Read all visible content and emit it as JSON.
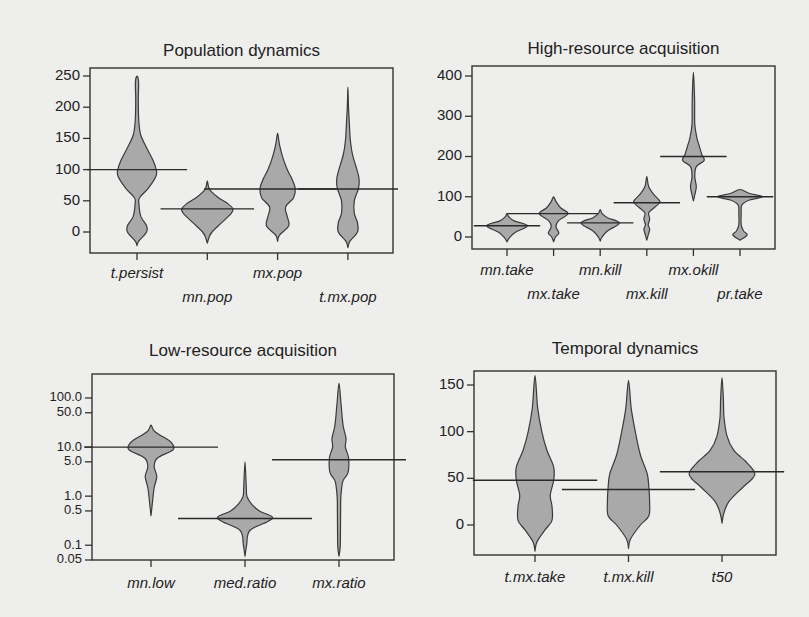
{
  "colors": {
    "violin_fill": "#a9a9a9",
    "violin_stroke": "#3a3a3a",
    "background": "#eeeeec"
  },
  "chart_data": [
    {
      "type": "violin",
      "title": "Population dynamics",
      "yscale": "linear",
      "ylim": [
        -30,
        260
      ],
      "yticks": [
        0,
        50,
        100,
        150,
        200,
        250
      ],
      "ytick_labels": [
        "0",
        "50",
        "100",
        "150",
        "200",
        "250"
      ],
      "categories": [
        "t.persist",
        "mn.pop",
        "mx.pop",
        "t.mx.pop"
      ],
      "label_rows": [
        0,
        1,
        0,
        1
      ],
      "violins": [
        {
          "name": "t.persist",
          "median": 100,
          "median_span": 1.5,
          "profile": [
            [
              -22,
              0
            ],
            [
              -15,
              0.05
            ],
            [
              0,
              0.3
            ],
            [
              10,
              0.3
            ],
            [
              25,
              0.12
            ],
            [
              45,
              0.06
            ],
            [
              55,
              0.08
            ],
            [
              70,
              0.35
            ],
            [
              90,
              0.6
            ],
            [
              100,
              0.6
            ],
            [
              115,
              0.5
            ],
            [
              135,
              0.3
            ],
            [
              155,
              0.12
            ],
            [
              175,
              0.06
            ],
            [
              210,
              0.04
            ],
            [
              240,
              0.05
            ],
            [
              250,
              0
            ]
          ]
        },
        {
          "name": "mn.pop",
          "median": 37,
          "median_span": 1.4,
          "profile": [
            [
              -18,
              0
            ],
            [
              -8,
              0.06
            ],
            [
              0,
              0.15
            ],
            [
              15,
              0.45
            ],
            [
              30,
              0.75
            ],
            [
              37,
              0.8
            ],
            [
              45,
              0.65
            ],
            [
              55,
              0.35
            ],
            [
              65,
              0.12
            ],
            [
              72,
              0.04
            ],
            [
              82,
              0
            ]
          ]
        },
        {
          "name": "mx.pop",
          "median": 69,
          "median_span": 2.2,
          "profile": [
            [
              -15,
              0
            ],
            [
              -5,
              0.06
            ],
            [
              10,
              0.35
            ],
            [
              25,
              0.3
            ],
            [
              40,
              0.25
            ],
            [
              55,
              0.5
            ],
            [
              70,
              0.55
            ],
            [
              85,
              0.45
            ],
            [
              100,
              0.3
            ],
            [
              120,
              0.16
            ],
            [
              140,
              0.06
            ],
            [
              158,
              0
            ]
          ]
        },
        {
          "name": "t.mx.pop",
          "median": 69,
          "median_span": 1.5,
          "profile": [
            [
              -25,
              0
            ],
            [
              -15,
              0.06
            ],
            [
              0,
              0.3
            ],
            [
              15,
              0.3
            ],
            [
              30,
              0.2
            ],
            [
              50,
              0.2
            ],
            [
              70,
              0.33
            ],
            [
              85,
              0.35
            ],
            [
              100,
              0.28
            ],
            [
              125,
              0.14
            ],
            [
              145,
              0.08
            ],
            [
              160,
              0.06
            ],
            [
              200,
              0.02
            ],
            [
              232,
              0
            ]
          ]
        }
      ]
    },
    {
      "type": "violin",
      "title": "High-resource acquisition",
      "yscale": "linear",
      "ylim": [
        -25,
        420
      ],
      "yticks": [
        0,
        100,
        200,
        300,
        400
      ],
      "ytick_labels": [
        "0",
        "100",
        "200",
        "300",
        "400"
      ],
      "categories": [
        "mn.take",
        "mx.take",
        "mn.kill",
        "mx.kill",
        "mx.okill",
        "pr.take"
      ],
      "label_rows": [
        0,
        1,
        0,
        1,
        0,
        1
      ],
      "violins": [
        {
          "name": "mn.take",
          "median": 28,
          "median_span": 1.5,
          "profile": [
            [
              -12,
              0
            ],
            [
              -2,
              0.1
            ],
            [
              12,
              0.35
            ],
            [
              28,
              0.85
            ],
            [
              40,
              0.3
            ],
            [
              50,
              0.08
            ],
            [
              58,
              0
            ]
          ]
        },
        {
          "name": "mx.take",
          "median": 58,
          "median_span": 2.1,
          "profile": [
            [
              -12,
              0
            ],
            [
              0,
              0.08
            ],
            [
              10,
              0.22
            ],
            [
              25,
              0.1
            ],
            [
              40,
              0.2
            ],
            [
              58,
              0.6
            ],
            [
              72,
              0.3
            ],
            [
              88,
              0.1
            ],
            [
              100,
              0
            ]
          ]
        },
        {
          "name": "mn.kill",
          "median": 35,
          "median_span": 1.5,
          "profile": [
            [
              -10,
              0
            ],
            [
              0,
              0.08
            ],
            [
              15,
              0.3
            ],
            [
              35,
              0.8
            ],
            [
              48,
              0.3
            ],
            [
              58,
              0.08
            ],
            [
              68,
              0
            ]
          ]
        },
        {
          "name": "mx.kill",
          "median": 85,
          "median_span": 1.5,
          "profile": [
            [
              -8,
              0
            ],
            [
              5,
              0.06
            ],
            [
              20,
              0.12
            ],
            [
              30,
              0.06
            ],
            [
              45,
              0.12
            ],
            [
              60,
              0.08
            ],
            [
              75,
              0.35
            ],
            [
              88,
              0.55
            ],
            [
              105,
              0.3
            ],
            [
              125,
              0.08
            ],
            [
              150,
              0
            ]
          ]
        },
        {
          "name": "mx.okill",
          "median": 200,
          "median_span": 1.5,
          "profile": [
            [
              90,
              0
            ],
            [
              105,
              0.06
            ],
            [
              125,
              0.12
            ],
            [
              150,
              0.06
            ],
            [
              175,
              0.12
            ],
            [
              190,
              0.45
            ],
            [
              205,
              0.35
            ],
            [
              225,
              0.25
            ],
            [
              245,
              0.15
            ],
            [
              280,
              0.06
            ],
            [
              340,
              0.05
            ],
            [
              410,
              0
            ]
          ]
        },
        {
          "name": "pr.take",
          "median": 100,
          "median_span": 1.5,
          "profile": [
            [
              -8,
              0
            ],
            [
              5,
              0.3
            ],
            [
              15,
              0.15
            ],
            [
              30,
              0.05
            ],
            [
              60,
              0.05
            ],
            [
              80,
              0.08
            ],
            [
              92,
              0.4
            ],
            [
              100,
              0.95
            ],
            [
              108,
              0.4
            ],
            [
              118,
              0
            ]
          ]
        }
      ]
    },
    {
      "type": "violin",
      "title": "Low-resource acquisition",
      "yscale": "log",
      "ylim": [
        0.05,
        250
      ],
      "yticks": [
        0.05,
        0.1,
        0.5,
        1.0,
        5.0,
        10.0,
        50.0,
        100.0
      ],
      "ytick_labels": [
        "0.05",
        "0.1",
        "0.5",
        "1.0",
        "5.0",
        "10.0",
        "50.0",
        "100.0"
      ],
      "categories": [
        "mn.low",
        "med.ratio",
        "mx.ratio"
      ],
      "label_rows": [
        0,
        0,
        0
      ],
      "violins": [
        {
          "name": "mn.low",
          "median": 10,
          "median_span": 1.5,
          "profile": [
            [
              0.4,
              0
            ],
            [
              0.8,
              0.05
            ],
            [
              1.5,
              0.1
            ],
            [
              2.5,
              0.18
            ],
            [
              4,
              0.1
            ],
            [
              6,
              0.2
            ],
            [
              9,
              0.7
            ],
            [
              13,
              0.6
            ],
            [
              18,
              0.25
            ],
            [
              22,
              0.08
            ],
            [
              28,
              0
            ]
          ]
        },
        {
          "name": "med.ratio",
          "median": 0.35,
          "median_span": 1.5,
          "profile": [
            [
              0.06,
              0
            ],
            [
              0.1,
              0.05
            ],
            [
              0.2,
              0.15
            ],
            [
              0.3,
              0.7
            ],
            [
              0.38,
              0.85
            ],
            [
              0.5,
              0.45
            ],
            [
              0.7,
              0.2
            ],
            [
              1.0,
              0.06
            ],
            [
              1.5,
              0.04
            ],
            [
              5,
              0
            ]
          ]
        },
        {
          "name": "mx.ratio",
          "median": 5.5,
          "median_span": 1.5,
          "profile": [
            [
              0.06,
              0
            ],
            [
              0.1,
              0.04
            ],
            [
              0.5,
              0.05
            ],
            [
              1,
              0.06
            ],
            [
              2,
              0.12
            ],
            [
              3,
              0.28
            ],
            [
              6,
              0.3
            ],
            [
              10,
              0.2
            ],
            [
              15,
              0.22
            ],
            [
              25,
              0.14
            ],
            [
              40,
              0.1
            ],
            [
              80,
              0.06
            ],
            [
              200,
              0
            ]
          ]
        }
      ]
    },
    {
      "type": "violin",
      "title": "Temporal dynamics",
      "yscale": "linear",
      "ylim": [
        -35,
        165
      ],
      "yticks": [
        0,
        50,
        100,
        150
      ],
      "ytick_labels": [
        "0",
        "50",
        "100",
        "150"
      ],
      "categories": [
        "t.mx.take",
        "t.mx.kill",
        "t50"
      ],
      "label_rows": [
        0,
        0,
        0
      ],
      "violins": [
        {
          "name": "t.mx.take",
          "median": 48,
          "median_span": 1.4,
          "profile": [
            [
              -28,
              0
            ],
            [
              -18,
              0.06
            ],
            [
              -5,
              0.3
            ],
            [
              5,
              0.5
            ],
            [
              20,
              0.5
            ],
            [
              32,
              0.45
            ],
            [
              48,
              0.55
            ],
            [
              62,
              0.55
            ],
            [
              80,
              0.35
            ],
            [
              100,
              0.2
            ],
            [
              125,
              0.08
            ],
            [
              160,
              0
            ]
          ]
        },
        {
          "name": "t.mx.kill",
          "median": 38,
          "median_span": 1.5,
          "profile": [
            [
              -25,
              0
            ],
            [
              -15,
              0.06
            ],
            [
              0,
              0.35
            ],
            [
              10,
              0.6
            ],
            [
              25,
              0.62
            ],
            [
              40,
              0.6
            ],
            [
              55,
              0.55
            ],
            [
              75,
              0.35
            ],
            [
              100,
              0.2
            ],
            [
              125,
              0.08
            ],
            [
              155,
              0
            ]
          ]
        },
        {
          "name": "t50",
          "median": 57,
          "median_span": 1.4,
          "profile": [
            [
              2,
              0
            ],
            [
              12,
              0.05
            ],
            [
              25,
              0.2
            ],
            [
              40,
              0.6
            ],
            [
              50,
              0.9
            ],
            [
              57,
              0.95
            ],
            [
              68,
              0.7
            ],
            [
              80,
              0.35
            ],
            [
              95,
              0.15
            ],
            [
              115,
              0.06
            ],
            [
              135,
              0.04
            ],
            [
              158,
              0
            ]
          ]
        }
      ]
    }
  ]
}
